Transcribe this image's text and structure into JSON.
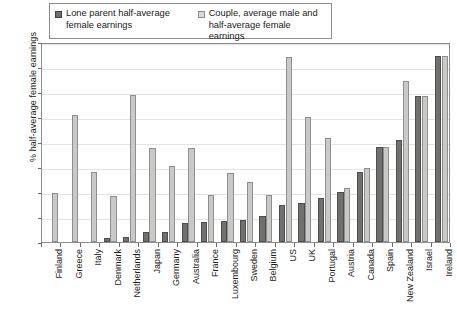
{
  "chart_data": {
    "type": "bar",
    "title": "",
    "xlabel": "",
    "ylabel": "% half-average female earnings",
    "ylim": [
      0,
      80
    ],
    "yticks": [
      0,
      10,
      20,
      30,
      40,
      50,
      60,
      70,
      80
    ],
    "grid": true,
    "legend_position": "top-left",
    "categories": [
      "Finland",
      "Greece",
      "Italy",
      "Denmark",
      "Netherlands",
      "Japan",
      "Germany",
      "Australia",
      "France",
      "Luxembourg",
      "Sweden",
      "Belgium",
      "US",
      "UK",
      "Portugal",
      "Austria",
      "Canada",
      "Spain",
      "New Zealand",
      "Israel",
      "Ireland"
    ],
    "series": [
      {
        "name": "Lone parent half-average female earnings",
        "color": "#70706f",
        "values": [
          0,
          0,
          0,
          1.5,
          2,
          4,
          4,
          7.5,
          8,
          8.5,
          9,
          10.5,
          15,
          15.5,
          17.5,
          20,
          28,
          38,
          41,
          58.5,
          74.5
        ]
      },
      {
        "name": "Couple, average male and half-average female earnings",
        "color": "#c9c9c7",
        "values": [
          19.5,
          51,
          28,
          18.5,
          59,
          37.5,
          30.5,
          37.5,
          19,
          27.5,
          24,
          19,
          74,
          50,
          41.5,
          21.5,
          29.5,
          38,
          64.5,
          58.5,
          74.5
        ]
      }
    ]
  },
  "legend": {
    "items": [
      {
        "label_line1": "Lone parent half-average",
        "label_line2": "female earnings",
        "swatch": "dark"
      },
      {
        "label_line1": "Couple, average male and",
        "label_line2": "half-average female earnings",
        "swatch": "light"
      }
    ]
  },
  "axis": {
    "y_title": "% half-average female earnings"
  }
}
